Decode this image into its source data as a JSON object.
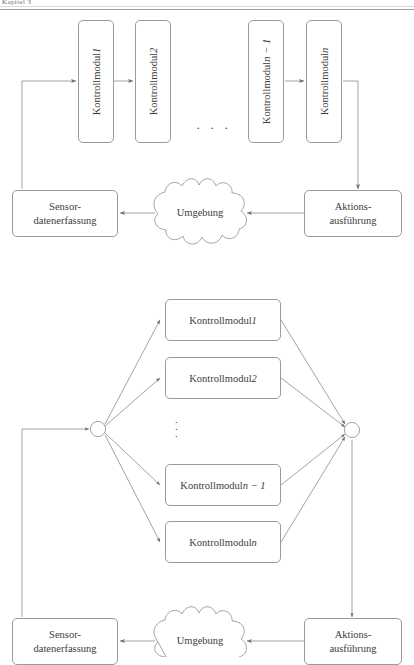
{
  "page": {
    "header_fragment": "Kapitel 3",
    "background": "#ffffff",
    "stroke_color": "#9a9a9f",
    "text_color": "#3c3c3c"
  },
  "figure_sequential": {
    "name": "sequentielle-architektur",
    "modules": [
      {
        "id": "km1",
        "label_prefix": "Kontrollmodul ",
        "label_var": "1",
        "label": "Kontrollmodul 1"
      },
      {
        "id": "km2",
        "label_prefix": "Kontrollmodul ",
        "label_var": "2",
        "label": "Kontrollmodul 2"
      },
      {
        "id": "kmn1",
        "label_prefix": "Kontrollmodul ",
        "label_var": "n − 1",
        "label": "Kontrollmodul n − 1"
      },
      {
        "id": "kmn",
        "label_prefix": "Kontrollmodul ",
        "label_var": "n",
        "label": "Kontrollmodul n"
      }
    ],
    "ellipsis": "· · ·",
    "sensor_box": {
      "line1": "Sensor-",
      "line2": "datenerfassung"
    },
    "action_box": {
      "line1": "Aktions-",
      "line2": "ausführung"
    },
    "environment": {
      "label": "Umgebung"
    }
  },
  "figure_parallel": {
    "name": "parallele-architektur",
    "modules": [
      {
        "id": "pkm1",
        "label_prefix": "Kontrollmodul ",
        "label_var": "1",
        "label": "Kontrollmodul 1"
      },
      {
        "id": "pkm2",
        "label_prefix": "Kontrollmodul ",
        "label_var": "2",
        "label": "Kontrollmodul 2"
      },
      {
        "id": "pkmn1",
        "label_prefix": "Kontrollmodul ",
        "label_var": "n − 1",
        "label": "Kontrollmodul n − 1"
      },
      {
        "id": "pkmn",
        "label_prefix": "Kontrollmodul ",
        "label_var": "n",
        "label": "Kontrollmodul n"
      }
    ],
    "ellipsis": "⋮",
    "split_node": {
      "label": ""
    },
    "join_node": {
      "label": ""
    },
    "sensor_box": {
      "line1": "Sensor-",
      "line2": "datenerfassung"
    },
    "action_box": {
      "line1": "Aktions-",
      "line2": "ausführung"
    },
    "environment": {
      "label": "Umgebung"
    }
  }
}
